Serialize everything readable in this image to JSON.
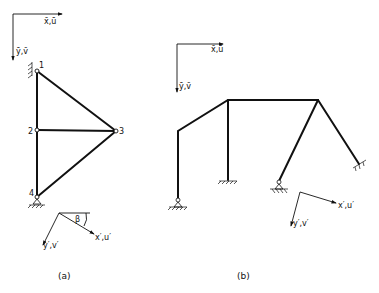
{
  "figure_a": {
    "caption": "(a)",
    "global_axes": {
      "x_label": "x̄,ū",
      "y_label": "ȳ,v̄"
    },
    "local_axes": {
      "x_label": "x′,u′",
      "y_label": "y′,v′",
      "angle_label": "β"
    },
    "nodes": [
      {
        "id": "1",
        "label": "1"
      },
      {
        "id": "2",
        "label": "2"
      },
      {
        "id": "3",
        "label": "3"
      },
      {
        "id": "4",
        "label": "4"
      }
    ],
    "members": [
      [
        "1",
        "2"
      ],
      [
        "2",
        "4"
      ],
      [
        "1",
        "3"
      ],
      [
        "2",
        "3"
      ],
      [
        "4",
        "3"
      ]
    ]
  },
  "figure_b": {
    "caption": "(b)",
    "global_axes": {
      "x_label": "x̄,ū",
      "y_label": "ȳ,v̄"
    },
    "local_axes": {
      "x_label": "x′,u′",
      "y_label": "y′,v′"
    }
  }
}
